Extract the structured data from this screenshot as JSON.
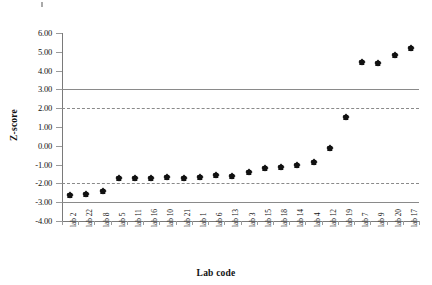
{
  "chart_data": {
    "type": "scatter",
    "title": "",
    "xlabel": "Lab code",
    "ylabel": "Z-score",
    "categories": [
      "lab 2",
      "lab 22",
      "lab 8",
      "lab 5",
      "lab 11",
      "lab 16",
      "lab 10",
      "lab 21",
      "lab 1",
      "lab 6",
      "lab 13",
      "lab 3",
      "lab 15",
      "lab 18",
      "lab 14",
      "lab 4",
      "lab 12",
      "lab 19",
      "lab 7",
      "lab 9",
      "lab 20",
      "lab 17"
    ],
    "values": [
      -2.6,
      -2.55,
      -2.4,
      -1.7,
      -1.7,
      -1.72,
      -1.68,
      -1.7,
      -1.65,
      -1.55,
      -1.6,
      -1.4,
      -1.2,
      -1.15,
      -1.0,
      -0.85,
      -0.1,
      1.55,
      4.45,
      4.4,
      4.85,
      5.2
    ],
    "ylim": [
      -4.0,
      6.0
    ],
    "ytick_labels": [
      "6.00",
      "5.00",
      "4.00",
      "3.00",
      "2.00",
      "1.00",
      "0.00",
      "-1.00",
      "-2.00",
      "-3.00",
      "-4.00"
    ],
    "ytick_values": [
      6,
      5,
      4,
      3,
      2,
      1,
      0,
      -1,
      -2,
      -3,
      -4
    ],
    "grid": false,
    "legend": "none",
    "marker_shape": "diamond",
    "marker_color": "#111111",
    "reference_lines": [
      {
        "value": 3,
        "style": "solid",
        "color": "#8a8a8a",
        "label": "warning-upper-3"
      },
      {
        "value": 2,
        "style": "dashed",
        "color": "#8a8a8a",
        "label": "action-upper-2"
      },
      {
        "value": -2,
        "style": "dashed",
        "color": "#8a8a8a",
        "label": "action-lower-2"
      },
      {
        "value": -3,
        "style": "solid",
        "color": "#8a8a8a",
        "label": "warning-lower-3"
      }
    ]
  }
}
